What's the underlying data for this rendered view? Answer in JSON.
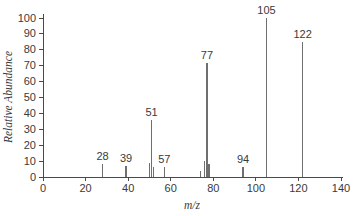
{
  "chart_data": {
    "type": "bar",
    "subtype": "mass-spectrum",
    "title": "",
    "xlabel": "m/z",
    "ylabel": "Relative Abundance",
    "xlim": [
      0,
      140
    ],
    "ylim": [
      0,
      100
    ],
    "x_ticks": [
      0,
      20,
      40,
      60,
      80,
      100,
      120,
      140
    ],
    "y_ticks": [
      0,
      10,
      20,
      30,
      40,
      50,
      60,
      70,
      80,
      90,
      100
    ],
    "grid": false,
    "legend": false,
    "peaks": [
      {
        "mz": 28,
        "intensity": 8,
        "label": "28"
      },
      {
        "mz": 39,
        "intensity": 7,
        "label": "39"
      },
      {
        "mz": 50,
        "intensity": 9,
        "label": ""
      },
      {
        "mz": 51,
        "intensity": 36,
        "label": "51"
      },
      {
        "mz": 52,
        "intensity": 6,
        "label": ""
      },
      {
        "mz": 57,
        "intensity": 6,
        "label": "57"
      },
      {
        "mz": 74,
        "intensity": 4,
        "label": ""
      },
      {
        "mz": 76,
        "intensity": 10,
        "label": ""
      },
      {
        "mz": 77,
        "intensity": 72,
        "label": "77"
      },
      {
        "mz": 78,
        "intensity": 8,
        "label": ""
      },
      {
        "mz": 94,
        "intensity": 6,
        "label": "94"
      },
      {
        "mz": 105,
        "intensity": 100,
        "label": "105"
      },
      {
        "mz": 122,
        "intensity": 85,
        "label": "122"
      }
    ],
    "colors": {
      "bar": "#6f6f6f",
      "axis": "#4a4a4a",
      "tick_text": "#3a3a3a",
      "peak_label_text": "#3a3a3a",
      "background": "#ffffff"
    }
  }
}
